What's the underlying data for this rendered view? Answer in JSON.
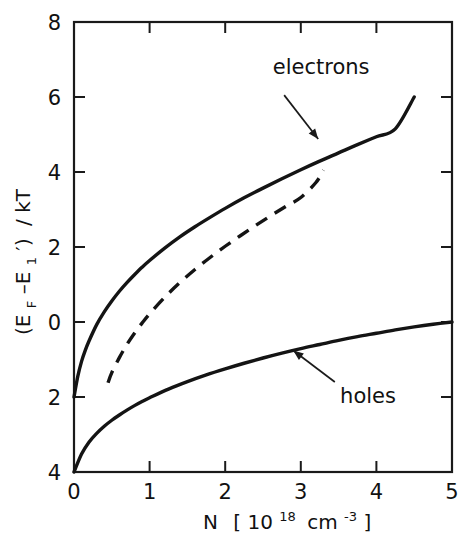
{
  "chart_data": {
    "type": "line",
    "title": "",
    "xlabel": "N [10^18 cm^-3]",
    "ylabel": "(E_F - E_1') / kT",
    "xlim": [
      0,
      5
    ],
    "ylim": [
      -4,
      8
    ],
    "grid": false,
    "legend_position": "inline-annotations",
    "x_ticks": [
      0,
      1,
      2,
      3,
      4,
      5
    ],
    "x_tick_labels": [
      "0",
      "1",
      "2",
      "3",
      "4",
      "5"
    ],
    "y_ticks": [
      8,
      6,
      4,
      2,
      0,
      -2,
      -4
    ],
    "y_tick_labels": [
      "8",
      "6",
      "4",
      "2",
      "0",
      "2",
      "4"
    ],
    "series": [
      {
        "name": "electrons",
        "style": "solid",
        "annotation": "electrons",
        "points": [
          [
            0.0,
            -2.0
          ],
          [
            0.05,
            -1.45
          ],
          [
            0.1,
            -1.05
          ],
          [
            0.15,
            -0.75
          ],
          [
            0.2,
            -0.5
          ],
          [
            0.3,
            -0.07
          ],
          [
            0.4,
            0.27
          ],
          [
            0.5,
            0.56
          ],
          [
            0.6,
            0.82
          ],
          [
            0.7,
            1.05
          ],
          [
            0.8,
            1.26
          ],
          [
            0.9,
            1.46
          ],
          [
            1.0,
            1.64
          ],
          [
            1.2,
            1.97
          ],
          [
            1.4,
            2.27
          ],
          [
            1.6,
            2.54
          ],
          [
            1.8,
            2.79
          ],
          [
            2.0,
            3.03
          ],
          [
            2.25,
            3.31
          ],
          [
            2.5,
            3.57
          ],
          [
            2.75,
            3.82
          ],
          [
            3.0,
            4.06
          ],
          [
            3.25,
            4.29
          ],
          [
            3.5,
            4.51
          ],
          [
            3.75,
            4.73
          ],
          [
            4.0,
            4.94
          ],
          [
            4.25,
            5.15
          ],
          [
            4.5,
            6.0
          ]
        ]
      },
      {
        "name": "electrons-approximation",
        "style": "dashed",
        "annotation": "",
        "points": [
          [
            0.45,
            -1.62
          ],
          [
            0.5,
            -1.35
          ],
          [
            0.6,
            -0.95
          ],
          [
            0.7,
            -0.6
          ],
          [
            0.8,
            -0.3
          ],
          [
            0.9,
            -0.03
          ],
          [
            1.0,
            0.22
          ],
          [
            1.2,
            0.66
          ],
          [
            1.4,
            1.05
          ],
          [
            1.6,
            1.4
          ],
          [
            1.8,
            1.72
          ],
          [
            2.0,
            2.02
          ],
          [
            2.2,
            2.3
          ],
          [
            2.4,
            2.57
          ],
          [
            2.6,
            2.83
          ],
          [
            2.8,
            3.08
          ],
          [
            3.0,
            3.32
          ],
          [
            3.2,
            3.72
          ],
          [
            3.3,
            4.05
          ]
        ]
      },
      {
        "name": "holes",
        "style": "solid",
        "annotation": "holes",
        "points": [
          [
            0.0,
            -4.0
          ],
          [
            0.1,
            -3.52
          ],
          [
            0.2,
            -3.2
          ],
          [
            0.3,
            -2.97
          ],
          [
            0.4,
            -2.78
          ],
          [
            0.5,
            -2.62
          ],
          [
            0.6,
            -2.48
          ],
          [
            0.7,
            -2.35
          ],
          [
            0.8,
            -2.23
          ],
          [
            0.9,
            -2.12
          ],
          [
            1.0,
            -2.02
          ],
          [
            1.25,
            -1.79
          ],
          [
            1.5,
            -1.59
          ],
          [
            1.75,
            -1.41
          ],
          [
            2.0,
            -1.25
          ],
          [
            2.25,
            -1.1
          ],
          [
            2.5,
            -0.96
          ],
          [
            2.75,
            -0.83
          ],
          [
            3.0,
            -0.71
          ],
          [
            3.25,
            -0.6
          ],
          [
            3.5,
            -0.49
          ],
          [
            3.75,
            -0.39
          ],
          [
            4.0,
            -0.3
          ],
          [
            4.25,
            -0.21
          ],
          [
            4.5,
            -0.13
          ],
          [
            4.75,
            -0.06
          ],
          [
            5.0,
            0.0
          ]
        ]
      }
    ],
    "annotations": [
      {
        "label": "electrons",
        "label_x": 2.63,
        "label_y": 6.62,
        "arrow_from_x": 2.78,
        "arrow_from_y": 6.05,
        "arrow_to_x": 3.23,
        "arrow_to_y": 4.88
      },
      {
        "label": "holes",
        "label_x": 3.52,
        "label_y": -2.15,
        "arrow_from_x": 3.45,
        "arrow_from_y": -1.6,
        "arrow_to_x": 2.9,
        "arrow_to_y": -0.76
      }
    ]
  },
  "axis_titles": {
    "x_main": "N",
    "x_bracket_open": "[",
    "x_base": "10",
    "x_exponent": "18",
    "x_unit": "cm",
    "x_unit_exponent": "-3",
    "x_bracket_close": "]",
    "y_open": "(E",
    "y_sub_f": "F",
    "y_minus": "–E",
    "y_sub_1": "1",
    "y_prime": "′)",
    "y_tail": "/ kT"
  }
}
